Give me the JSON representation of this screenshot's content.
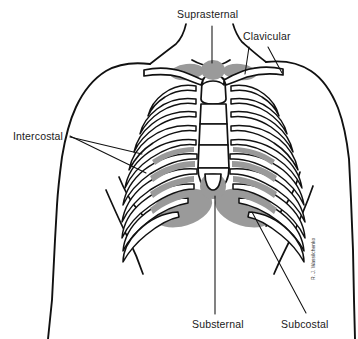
{
  "figure": {
    "type": "anatomical-diagram",
    "view": "anterior chest and rib cage",
    "background_color": "#ffffff",
    "line_color": "#111111",
    "shading_color": "#9a9a9a",
    "artist_signature": "R. J. Wassilchenko"
  },
  "labels": {
    "suprasternal": {
      "text": "Suprasternal",
      "x": 177,
      "y": 18,
      "leader_from": [
        212,
        26
      ],
      "leader_to": [
        212,
        63
      ]
    },
    "clavicular": {
      "text": "Clavicular",
      "x": 243,
      "y": 40,
      "leader_a_from": [
        250,
        48
      ],
      "leader_a_to": [
        246,
        73
      ],
      "leader_b_from": [
        268,
        48
      ],
      "leader_b_to": [
        280,
        72
      ]
    },
    "intercostal": {
      "text": "Intercostal",
      "x": 13,
      "y": 140,
      "leader_a_from": [
        70,
        136
      ],
      "leader_a_to": [
        143,
        170
      ],
      "leader_b_from": [
        70,
        137
      ],
      "leader_b_to": [
        140,
        153
      ]
    },
    "substernal": {
      "text": "Substernal",
      "x": 192,
      "y": 327,
      "leader_from": [
        215,
        315
      ],
      "leader_to": [
        215,
        195
      ]
    },
    "subcostal": {
      "text": "Subcostal",
      "x": 281,
      "y": 327,
      "leader_from": [
        305,
        314
      ],
      "leader_to": [
        252,
        213
      ]
    }
  },
  "anatomy": {
    "regions": [
      "suprasternal notch",
      "clavicular fossae",
      "intercostal spaces",
      "substernal / xiphoid area",
      "subcostal margins"
    ],
    "rib_pair_count": 10,
    "sternum_segments": 5
  }
}
